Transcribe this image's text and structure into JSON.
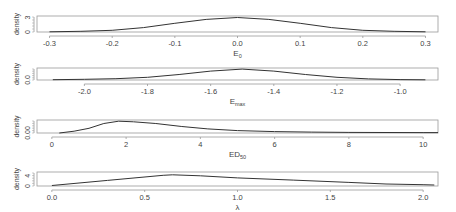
{
  "figure": {
    "width": 456,
    "height": 212,
    "line_color": "#333333",
    "frame_color": "#999999"
  },
  "chart_data": [
    {
      "type": "line",
      "title": "",
      "xlabel": "E_0",
      "xlabel_main": "E",
      "xlabel_sub": "0",
      "ylabel": "density",
      "ytick_labels": [
        "0",
        "3"
      ],
      "yticks": [
        0,
        3
      ],
      "ylim": [
        0,
        3.3
      ],
      "xlim": [
        -0.32,
        0.32
      ],
      "xticks": [
        -0.3,
        -0.2,
        -0.1,
        0.0,
        0.1,
        0.2,
        0.3
      ],
      "xtick_labels": [
        "-0.3",
        "-0.2",
        "-0.1",
        "0.0",
        "0.1",
        "0.2",
        "0.3"
      ],
      "grid": false,
      "x": [
        -0.3,
        -0.25,
        -0.2,
        -0.15,
        -0.1,
        -0.05,
        0.0,
        0.05,
        0.1,
        0.15,
        0.2,
        0.25,
        0.3
      ],
      "y": [
        0.05,
        0.15,
        0.35,
        0.9,
        1.8,
        2.6,
        3.0,
        2.6,
        1.8,
        0.9,
        0.35,
        0.15,
        0.05
      ]
    },
    {
      "type": "line",
      "title": "",
      "xlabel": "E_max",
      "xlabel_main": "E",
      "xlabel_sub": "max",
      "ylabel": "density",
      "ytick_labels": [
        "0.0"
      ],
      "yticks": [
        0
      ],
      "ylim": [
        0,
        1.1
      ],
      "xlim": [
        -2.15,
        -0.88
      ],
      "xticks": [
        -2.0,
        -1.8,
        -1.6,
        -1.4,
        -1.2,
        -1.0
      ],
      "xtick_labels": [
        "-2.0",
        "-1.8",
        "-1.6",
        "-1.4",
        "-1.2",
        "-1.0"
      ],
      "grid": false,
      "x": [
        -2.1,
        -2.0,
        -1.9,
        -1.8,
        -1.7,
        -1.6,
        -1.5,
        -1.4,
        -1.3,
        -1.2,
        -1.1,
        -1.0,
        -0.92
      ],
      "y": [
        0.03,
        0.06,
        0.12,
        0.25,
        0.5,
        0.82,
        1.0,
        0.82,
        0.5,
        0.25,
        0.1,
        0.04,
        0.02
      ]
    },
    {
      "type": "line",
      "title": "",
      "xlabel": "ED_50",
      "xlabel_main": "ED",
      "xlabel_sub": "50",
      "ylabel": "density",
      "ytick_labels": [
        "0.00"
      ],
      "yticks": [
        0
      ],
      "ylim": [
        0,
        1.1
      ],
      "xlim": [
        -0.4,
        10.4
      ],
      "xticks": [
        0,
        2,
        4,
        6,
        8,
        10
      ],
      "xtick_labels": [
        "0",
        "2",
        "4",
        "6",
        "8",
        "10"
      ],
      "grid": false,
      "x": [
        0.2,
        0.6,
        1.0,
        1.4,
        1.8,
        2.2,
        2.8,
        3.5,
        4.2,
        5.0,
        6.0,
        7.0,
        8.0,
        9.0,
        10.0,
        10.4
      ],
      "y": [
        0.0,
        0.15,
        0.4,
        0.8,
        1.0,
        0.95,
        0.8,
        0.55,
        0.35,
        0.2,
        0.12,
        0.08,
        0.05,
        0.04,
        0.03,
        0.03
      ]
    },
    {
      "type": "line",
      "title": "",
      "xlabel": "λ",
      "xlabel_main": "λ",
      "xlabel_sub": "",
      "ylabel": "density",
      "ytick_labels": [
        "0",
        "4"
      ],
      "yticks": [
        0,
        4
      ],
      "ylim": [
        0,
        5.5
      ],
      "xlim": [
        -0.08,
        2.08
      ],
      "xticks": [
        0.0,
        0.5,
        1.0,
        1.5,
        2.0
      ],
      "xtick_labels": [
        "0.0",
        "0.5",
        "1.0",
        "1.5",
        "2.0"
      ],
      "grid": false,
      "x": [
        0.0,
        0.3,
        0.6,
        0.65,
        0.8,
        1.0,
        1.3,
        1.6,
        1.8,
        2.0,
        2.06
      ],
      "y": [
        0.2,
        2.2,
        4.2,
        4.4,
        4.0,
        3.2,
        2.3,
        1.4,
        0.8,
        0.5,
        0.4
      ]
    }
  ]
}
